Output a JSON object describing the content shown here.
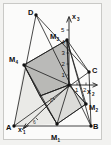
{
  "figure": {
    "background_color": "#fbfbfa",
    "frame_color": "#c9c9c6",
    "line_color": "#1b1b1b",
    "dark_face_color": "#b4b4b2",
    "light_face_color": "#d8d8d5"
  },
  "axes": [
    {
      "id": "x1",
      "label": "x",
      "subscript": "1",
      "direction": "down-left",
      "arrow": true
    },
    {
      "id": "x2",
      "label": "x",
      "subscript": "2",
      "direction": "right",
      "arrow": true
    },
    {
      "id": "x3",
      "label": "x",
      "subscript": "3",
      "direction": "up",
      "arrow": true
    }
  ],
  "ticks": {
    "x3": [
      "1",
      "2",
      "3",
      "4",
      "5"
    ],
    "x2": [
      "1",
      "2"
    ],
    "x1": [
      "2",
      "6"
    ]
  },
  "vertices": [
    {
      "name": "A",
      "subscript": "",
      "x": 14,
      "y": 126
    },
    {
      "name": "B",
      "subscript": "",
      "x": 91,
      "y": 126
    },
    {
      "name": "C",
      "subscript": "",
      "x": 89,
      "y": 72
    },
    {
      "name": "D",
      "subscript": "",
      "x": 36,
      "y": 15
    },
    {
      "name": "M",
      "subscript": "1",
      "x": 57,
      "y": 124
    },
    {
      "name": "M",
      "subscript": "2",
      "x": 86,
      "y": 104
    },
    {
      "name": "M",
      "subscript": "3",
      "x": 67,
      "y": 40
    },
    {
      "name": "M",
      "subscript": "4",
      "x": 24,
      "y": 65
    },
    {
      "name": "O",
      "subscript": "",
      "x": 69,
      "y": 85
    }
  ],
  "labels": {
    "A": "A",
    "B": "B",
    "C": "C",
    "D": "D",
    "M1": "M",
    "M2": "M",
    "M3": "M",
    "M4": "M",
    "sub1": "1",
    "sub2": "2",
    "sub3": "3",
    "sub4": "4",
    "axis_x": "x",
    "tick_x3_5": "5",
    "tick_x3_4": "4",
    "tick_x3_3": "3",
    "tick_x3_2": "2",
    "tick_x3_1": "1",
    "tick_x2_1": "1",
    "tick_x2_2": "2",
    "tick_x1_2": "2",
    "tick_x1_6": "6"
  }
}
